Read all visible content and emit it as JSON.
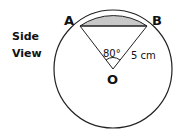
{
  "diagram": {
    "side_label_line1": "Side",
    "side_label_line2": "View",
    "point_a": "A",
    "point_b": "B",
    "center": "O",
    "angle_label": "80°",
    "radius_label": "5 cm",
    "segment_fill": "#c8c8c8"
  }
}
